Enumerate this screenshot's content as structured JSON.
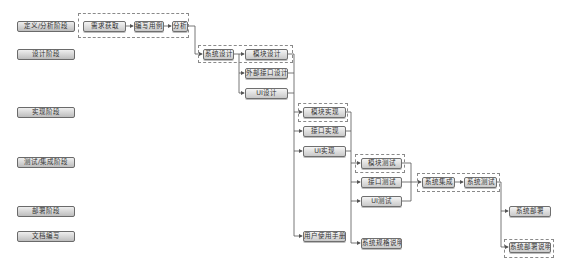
{
  "phases": [
    {
      "id": "define",
      "label": "定义/分析阶段"
    },
    {
      "id": "design",
      "label": "设计阶段"
    },
    {
      "id": "implement",
      "label": "实现阶段"
    },
    {
      "id": "test",
      "label": "测试/集成阶段"
    },
    {
      "id": "deploy",
      "label": "部署阶段"
    },
    {
      "id": "docs",
      "label": "文档编写"
    }
  ],
  "nodes": {
    "requirements": "需求获取",
    "use_cases": "编写用例",
    "analysis": "分析",
    "system_design": "系统设计",
    "module_design": "模块设计",
    "external_interface_design": "外部接口设计",
    "ui_design": "UI设计",
    "module_impl": "模块实现",
    "interface_impl": "接口实现",
    "ui_impl": "UI实现",
    "module_test": "模块测试",
    "interface_test": "接口测试",
    "ui_test": "UI测试",
    "system_integration": "系统集成",
    "system_test": "系统测试",
    "system_deploy": "系统部署",
    "user_manual": "用户使用手册",
    "system_spec": "系统规格说明",
    "deploy_doc": "系统部署说明"
  },
  "colors": {
    "line": "#555555",
    "node_border": "#6f6f6f",
    "dashed_group": "#8a8a8a"
  }
}
